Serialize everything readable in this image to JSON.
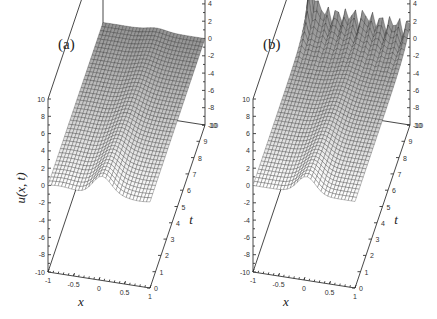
{
  "figure": {
    "y_axis_label": "u(x, t)",
    "panels": [
      {
        "id": "a",
        "label": "(a)"
      },
      {
        "id": "b",
        "label": "(b)"
      }
    ]
  },
  "chart_data": [
    {
      "type": "surface",
      "title": "(a)",
      "xlabel": "x",
      "ylabel": "t",
      "zlabel": "u(x, t)",
      "x_ticks": [
        "-1",
        "-0.5",
        "0",
        "0.5",
        "1"
      ],
      "t_ticks": [
        "0",
        "1",
        "2",
        "3",
        "4",
        "5",
        "6",
        "7",
        "8",
        "9",
        "10"
      ],
      "z_ticks": [
        "-10",
        "-8",
        "-6",
        "-4",
        "-2",
        "0",
        "2",
        "4",
        "6",
        "8",
        "10"
      ],
      "xlim": [
        -1,
        1
      ],
      "tlim": [
        0,
        10
      ],
      "zlim": [
        -10,
        10
      ],
      "description": "Localized hump (~2 high) centered at x≈0 at t=0, decaying and flattening toward ~0 as t increases to 10; surface remains bounded near zero."
    },
    {
      "type": "surface",
      "title": "(b)",
      "xlabel": "x",
      "ylabel": "t",
      "zlabel": "u(x, t)",
      "x_ticks": [
        "-1",
        "-0.5",
        "0",
        "0.5",
        "1"
      ],
      "t_ticks": [
        "0",
        "1",
        "2",
        "3",
        "4",
        "5",
        "6",
        "7",
        "8",
        "9",
        "10"
      ],
      "z_ticks": [
        "-10",
        "-8",
        "-6",
        "-4",
        "-2",
        "0",
        "2",
        "4",
        "6",
        "8",
        "10"
      ],
      "xlim": [
        -1,
        1
      ],
      "tlim": [
        0,
        10
      ],
      "zlim": [
        -10,
        10
      ],
      "description": "Same initial hump at t=0, but near t=10 strong oscillations develop: spikes up to ~10 near x=-1 and repeated oscillating peaks of ~2–3 along x at t≈10."
    }
  ]
}
